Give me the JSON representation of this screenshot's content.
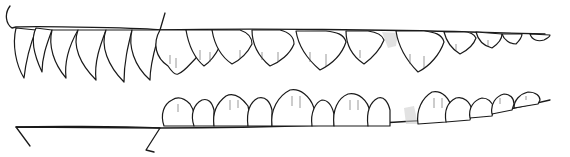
{
  "figure": {
    "ink_color": "#1a1a1a",
    "background": "#ffffff",
    "upper_row": {
      "sharp_teeth_count": 6,
      "serrated_teeth_count": 11
    },
    "lower_row": {
      "serrated_teeth_count": 13
    },
    "scale_bar": {
      "present": true,
      "label": ""
    }
  }
}
